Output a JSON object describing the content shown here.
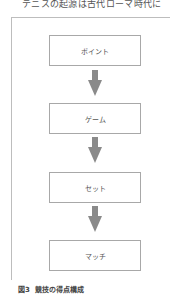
{
  "top_text": "テニスの起源は古代ローマ時代に",
  "diagram": {
    "boxes": [
      {
        "label": "ポイント"
      },
      {
        "label": "ゲーム"
      },
      {
        "label": "セット"
      },
      {
        "label": "マッチ"
      }
    ],
    "arrow_color": "#888888"
  },
  "caption": {
    "figure_no": "図3",
    "title": "競技の得点構成"
  }
}
